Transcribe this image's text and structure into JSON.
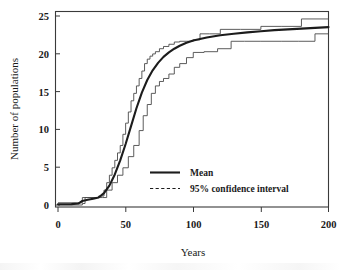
{
  "chart_data": {
    "type": "line",
    "title": "",
    "subtitle": "",
    "xlabel": "Years",
    "ylabel": "Number of populations",
    "xlim": [
      0,
      200
    ],
    "ylim": [
      0,
      26
    ],
    "xticks": [
      0,
      50,
      100,
      150,
      200
    ],
    "yticks": [
      0,
      5,
      10,
      15,
      20,
      25
    ],
    "xtick_labels": [
      "0",
      "50",
      "100",
      "150",
      "200"
    ],
    "ytick_labels": [
      "0",
      "5",
      "10",
      "15",
      "20",
      "25"
    ],
    "grid": false,
    "legend_position": "center-right-inside",
    "frame": "box",
    "series": [
      {
        "name": "Mean",
        "style": "solid",
        "color": "#1c1c1c",
        "x": [
          0,
          10,
          15,
          18,
          22,
          26,
          30,
          34,
          38,
          42,
          46,
          50,
          54,
          58,
          62,
          66,
          70,
          74,
          78,
          82,
          86,
          90,
          95,
          100,
          110,
          120,
          130,
          140,
          150,
          160,
          170,
          180,
          190,
          200
        ],
        "values": [
          0.1,
          0.12,
          0.2,
          0.55,
          0.7,
          0.85,
          1.0,
          1.6,
          2.6,
          4.1,
          6.0,
          8.2,
          10.6,
          13.0,
          15.1,
          16.8,
          18.1,
          19.1,
          19.9,
          20.5,
          21.0,
          21.4,
          21.8,
          22.1,
          22.5,
          22.8,
          23.0,
          23.2,
          23.35,
          23.5,
          23.6,
          23.7,
          23.8,
          23.9
        ]
      },
      {
        "name": "95% confidence interval upper",
        "style": "dashed",
        "color": "#4a4a4a",
        "x": [
          0,
          14,
          18,
          22,
          26,
          30,
          34,
          36,
          38,
          40,
          42,
          44,
          46,
          48,
          50,
          52,
          54,
          56,
          58,
          60,
          62,
          64,
          66,
          68,
          70,
          72,
          75,
          78,
          82,
          86,
          90,
          95,
          100,
          105,
          112,
          120,
          135,
          150,
          165,
          180,
          200
        ],
        "values": [
          0.3,
          0.3,
          1.0,
          1.0,
          1.0,
          1.2,
          2.0,
          3.0,
          4.0,
          5.0,
          6.0,
          7.0,
          8.0,
          9.5,
          11.0,
          12.5,
          14.0,
          15.0,
          16.0,
          17.0,
          18.0,
          19.0,
          19.6,
          20.0,
          20.3,
          20.6,
          21.0,
          21.3,
          21.6,
          21.9,
          22.0,
          22.0,
          22.2,
          23.0,
          23.0,
          23.6,
          23.6,
          24.0,
          24.0,
          25.0,
          25.0
        ]
      },
      {
        "name": "95% confidence interval lower",
        "style": "dashed",
        "color": "#4a4a4a",
        "x": [
          0,
          14,
          18,
          20,
          26,
          30,
          33,
          36,
          40,
          44,
          48,
          52,
          56,
          60,
          63,
          66,
          69,
          72,
          75,
          78,
          82,
          86,
          90,
          95,
          100,
          108,
          118,
          128,
          138,
          150,
          165,
          178,
          190,
          200
        ],
        "values": [
          0.0,
          0.0,
          0.2,
          1.0,
          1.0,
          1.0,
          1.0,
          2.0,
          3.0,
          4.0,
          5.0,
          6.5,
          8.0,
          10.0,
          12.0,
          13.5,
          15.0,
          16.0,
          16.6,
          17.0,
          17.6,
          18.5,
          19.0,
          19.8,
          20.5,
          20.6,
          21.0,
          22.0,
          22.0,
          22.0,
          22.0,
          22.0,
          23.0,
          23.0
        ]
      }
    ],
    "legend_entries": [
      {
        "label": "Mean",
        "style": "solid"
      },
      {
        "label": "95% confidence interval",
        "style": "dashed"
      }
    ],
    "colors": {
      "mean": "#1c1c1c",
      "confidence_interval": "#4a4a4a",
      "frame": "#3a3a3a",
      "background": "#ffffff"
    }
  }
}
